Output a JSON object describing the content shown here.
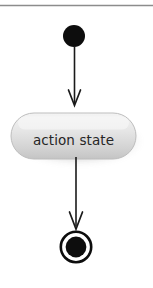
{
  "diagram": {
    "type": "uml-activity-diagram",
    "canvas": {
      "width": 153,
      "height": 288,
      "background": "#ffffff"
    },
    "top_rule": {
      "name": "horizontal-rule",
      "color": "#8c8c8c",
      "y": 5,
      "x_start": 0,
      "x_end": 153
    },
    "nodes": [
      {
        "id": "initial-node",
        "kind": "initial-state",
        "label": "",
        "color": "#0d0d0d",
        "cx": 74,
        "cy": 36,
        "r": 11
      },
      {
        "id": "action-state",
        "kind": "action-state",
        "label": "action state",
        "fill_top": "#f2f2f2",
        "fill_bottom": "#c9c9c9",
        "stroke": "#b5b5b5",
        "text_color": "#262626",
        "shadow_color": "#cfcfcf",
        "x": 11,
        "y": 113,
        "width": 125,
        "height": 46
      },
      {
        "id": "final-node",
        "kind": "final-state",
        "label": "",
        "ring_color": "#0d0d0d",
        "fill_color": "#0d0d0d",
        "cx": 76,
        "cy": 247,
        "outer_r": 16.5,
        "inner_r": 10.5
      }
    ],
    "transitions": [
      {
        "id": "transition-initial-to-action",
        "from": "initial-node",
        "to": "action-state",
        "label": "",
        "color": "#1a1a1a",
        "x": 74,
        "y_start": 47,
        "y_end": 106
      },
      {
        "id": "transition-action-to-final",
        "from": "action-state",
        "to": "final-node",
        "label": "",
        "color": "#1a1a1a",
        "x": 76,
        "y_start": 158,
        "y_end": 229
      }
    ]
  }
}
